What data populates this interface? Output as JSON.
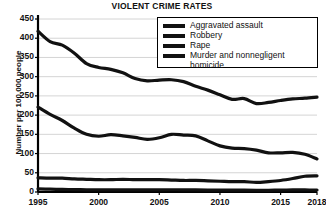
{
  "chart_data": {
    "type": "line",
    "title": "VIOLENT CRIME RATES",
    "xlabel": "",
    "ylabel": "Number per 100,000 people",
    "xlim": [
      1995,
      2018
    ],
    "ylim": [
      0,
      450
    ],
    "ytick_step": 50,
    "yticks": [
      0,
      50,
      100,
      150,
      200,
      250,
      300,
      350,
      400,
      450
    ],
    "xticks": [
      1995,
      2000,
      2005,
      2010,
      2015,
      2018
    ],
    "xtick_labels": [
      "1995",
      "2000",
      "2005",
      "2010",
      "2015",
      "2018"
    ],
    "ytick_labels": [
      "0",
      "50",
      "100",
      "150",
      "200",
      "250",
      "300",
      "350",
      "400",
      "450"
    ],
    "grid": true,
    "grid_axis": "y",
    "legend_position": "top-right",
    "x": [
      1995,
      1996,
      1997,
      1998,
      1999,
      2000,
      2001,
      2002,
      2003,
      2004,
      2005,
      2006,
      2007,
      2008,
      2009,
      2010,
      2011,
      2012,
      2013,
      2014,
      2015,
      2016,
      2017,
      2018
    ],
    "series": [
      {
        "name": "Aggravated assault",
        "values": [
          418,
          391,
          382,
          361,
          334,
          324,
          319,
          310,
          295,
          289,
          291,
          292,
          287,
          275,
          265,
          253,
          241,
          243,
          230,
          233,
          238,
          242,
          244,
          247
        ]
      },
      {
        "name": "Robbery",
        "values": [
          221,
          202,
          186,
          166,
          150,
          145,
          149,
          146,
          142,
          137,
          141,
          150,
          148,
          146,
          133,
          120,
          114,
          113,
          109,
          102,
          102,
          103,
          98,
          86
        ]
      },
      {
        "name": "Rape",
        "values": [
          37,
          36,
          36,
          34,
          33,
          32,
          32,
          33,
          32,
          32,
          32,
          31,
          30,
          30,
          29,
          28,
          27,
          27,
          25,
          27,
          30,
          35,
          41,
          42
        ]
      },
      {
        "name": "Murder and nonnegligent homicide",
        "values": [
          8.2,
          7.4,
          6.8,
          6.3,
          5.7,
          5.5,
          5.6,
          5.6,
          5.7,
          5.5,
          5.6,
          5.8,
          5.7,
          5.4,
          5.0,
          4.8,
          4.7,
          4.7,
          4.5,
          4.4,
          4.9,
          5.4,
          5.3,
          5.0
        ]
      }
    ],
    "series_color": "#111111",
    "colors": {
      "line": "#111111",
      "grid": "#c9c9c9",
      "axis": "#000000",
      "background": "#ffffff",
      "text": "#111111"
    }
  },
  "legend": {
    "entries": [
      {
        "label": "Aggravated assault"
      },
      {
        "label": "Robbery"
      },
      {
        "label": "Rape"
      },
      {
        "label": "Murder and nonnegligent\nhomicide"
      }
    ]
  }
}
